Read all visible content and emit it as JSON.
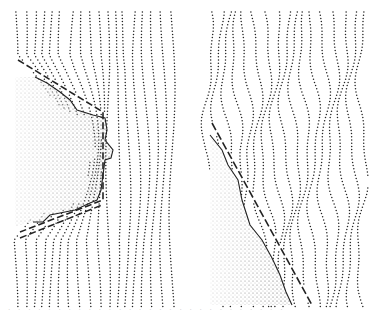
{
  "figure": {
    "type": "stipple-illustration",
    "colors": {
      "ink": "#222222",
      "background": "#ffffff"
    },
    "panels": [
      {
        "id": "left",
        "bounds": {
          "x0": 15,
          "y0": 12,
          "x1": 172,
          "y1": 308
        },
        "line_count": 18,
        "obstacle": {
          "outline": [
            [
              0,
              78
            ],
            [
              20,
              77
            ],
            [
              32,
              83
            ],
            [
              45,
              92
            ],
            [
              55,
              100
            ],
            [
              62,
              110
            ],
            [
              78,
              115
            ],
            [
              90,
              118
            ],
            [
              92,
              130
            ],
            [
              90,
              140
            ],
            [
              98,
              150
            ],
            [
              96,
              158
            ],
            [
              90,
              160
            ],
            [
              88,
              175
            ],
            [
              86,
              190
            ],
            [
              82,
              200
            ],
            [
              75,
              203
            ],
            [
              60,
              210
            ],
            [
              45,
              213
            ],
            [
              35,
              215
            ],
            [
              28,
              222
            ],
            [
              18,
              222
            ],
            [
              0,
              226
            ]
          ]
        },
        "dashed_boundary": [
          [
            18,
            60
          ],
          [
            103,
            112
          ],
          [
            103,
            200
          ],
          [
            20,
            232
          ]
        ],
        "dashed_boundary_2": [
          [
            20,
            238
          ],
          [
            102,
            205
          ]
        ]
      },
      {
        "id": "right",
        "bounds": {
          "x0": 208,
          "y0": 12,
          "x1": 362,
          "y1": 308
        },
        "line_count": 17,
        "obstacle": {
          "outline": [
            [
              210,
              135
            ],
            [
              222,
              150
            ],
            [
              228,
              165
            ],
            [
              238,
              180
            ],
            [
              242,
              200
            ],
            [
              250,
              225
            ],
            [
              262,
              240
            ],
            [
              272,
              258
            ],
            [
              280,
              275
            ],
            [
              286,
              292
            ],
            [
              292,
              305
            ],
            [
              210,
              305
            ]
          ]
        },
        "dashed_boundary": [
          [
            212,
            123
          ],
          [
            312,
            305
          ]
        ]
      }
    ],
    "caption_visible": false
  }
}
